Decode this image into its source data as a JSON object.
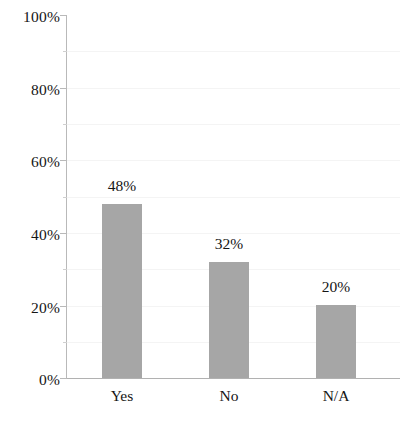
{
  "chart_data": {
    "type": "bar",
    "title": "",
    "xlabel": "",
    "ylabel": "",
    "categories": [
      "Yes",
      "No",
      "N/A"
    ],
    "values": [
      48,
      32,
      20
    ],
    "value_labels": [
      "48%",
      "32%",
      "20%"
    ],
    "ylim": [
      0,
      100
    ],
    "y_tick_labels": [
      "0%",
      "20%",
      "40%",
      "60%",
      "80%",
      "100%"
    ],
    "y_tick_values": [
      0,
      20,
      40,
      60,
      80,
      100
    ],
    "y_minor_tick_values": [
      10,
      30,
      50,
      70,
      90
    ],
    "grid": true,
    "grid_axis": "y",
    "legend": false,
    "legend_position": "none",
    "series": [
      {
        "name": "",
        "values": [
          48,
          32,
          20
        ]
      }
    ],
    "colors": {
      "bar_fill": "#a6a6a6",
      "text": "#151515",
      "axis_line": "#b9b9b9",
      "gridline": "#f4f4f4",
      "background": "#ffffff"
    }
  }
}
